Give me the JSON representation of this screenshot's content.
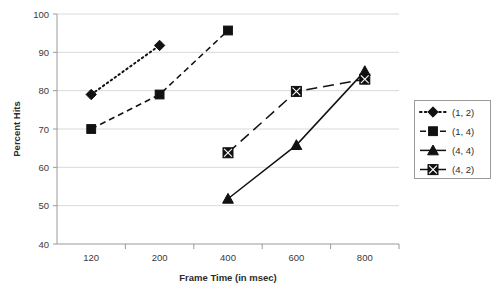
{
  "chart_data": {
    "type": "line",
    "title": "",
    "xlabel": "Frame Time (in msec)",
    "ylabel": "Percent Hits",
    "categories": [
      "120",
      "200",
      "400",
      "600",
      "800"
    ],
    "ylim": [
      40,
      100
    ],
    "yticks": [
      40,
      50,
      60,
      70,
      80,
      90,
      100
    ],
    "ytick_labels": [
      "40",
      "50",
      "60",
      "70",
      "80",
      "90",
      "100"
    ],
    "grid": "horizontal",
    "legend_position": "right-outside",
    "series": [
      {
        "name": "(1, 2)",
        "marker": "diamond",
        "line_style": "dotted",
        "color": "#111111",
        "points": [
          {
            "x": "120",
            "y": 79.0
          },
          {
            "x": "200",
            "y": 91.8
          }
        ]
      },
      {
        "name": "(1, 4)",
        "marker": "square",
        "line_style": "dashed",
        "color": "#111111",
        "points": [
          {
            "x": "120",
            "y": 70.0
          },
          {
            "x": "200",
            "y": 79.0
          },
          {
            "x": "400",
            "y": 95.7
          }
        ]
      },
      {
        "name": "(4, 4)",
        "marker": "triangle",
        "line_style": "solid",
        "color": "#111111",
        "points": [
          {
            "x": "400",
            "y": 51.8
          },
          {
            "x": "600",
            "y": 65.8
          },
          {
            "x": "800",
            "y": 85.1
          }
        ]
      },
      {
        "name": "(4, 2)",
        "marker": "square-x",
        "line_style": "long-dash",
        "color": "#111111",
        "points": [
          {
            "x": "400",
            "y": 63.8
          },
          {
            "x": "600",
            "y": 79.8
          },
          {
            "x": "800",
            "y": 83.0
          }
        ]
      }
    ]
  },
  "legend": {
    "entries": [
      "(1, 2)",
      "(1, 4)",
      "(4, 4)",
      "(4, 2)"
    ]
  },
  "colors": {
    "series": "#111111",
    "gridline": "#d9d9d9",
    "axis": "#9a9a9a",
    "text": "#2b2b2b",
    "background": "#ffffff"
  }
}
